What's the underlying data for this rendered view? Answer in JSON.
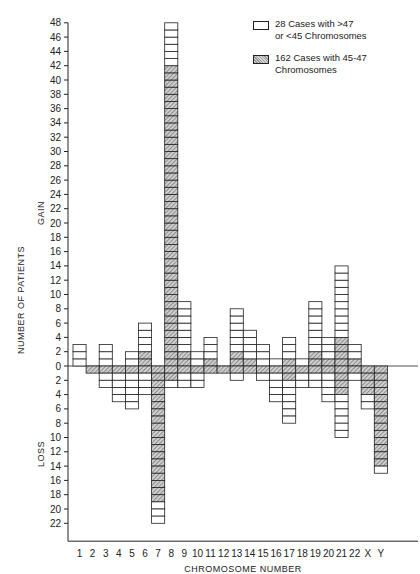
{
  "chart_data": {
    "type": "bar",
    "title": "",
    "xlabel": "CHROMOSOME NUMBER",
    "ylabel": "NUMBER OF PATIENTS",
    "y_region_labels": {
      "gain": "GAIN",
      "loss": "LOSS"
    },
    "categories": [
      "1",
      "2",
      "3",
      "4",
      "5",
      "6",
      "7",
      "8",
      "9",
      "10",
      "11",
      "12",
      "13",
      "14",
      "15",
      "16",
      "17",
      "18",
      "19",
      "20",
      "21",
      "22",
      "X",
      "Y"
    ],
    "y_ticks_gain": [
      0,
      2,
      4,
      6,
      8,
      10,
      12,
      14,
      16,
      18,
      20,
      22,
      24,
      26,
      28,
      30,
      32,
      34,
      36,
      38,
      40,
      42,
      44,
      46,
      48
    ],
    "y_ticks_loss": [
      2,
      4,
      6,
      8,
      10,
      12,
      14,
      16,
      18,
      20,
      22
    ],
    "ylim": [
      -24,
      48
    ],
    "series": [
      {
        "name": "28 Cases with >47 or <45 Chromosomes",
        "style": "open",
        "gain": [
          3,
          0,
          3,
          0,
          2,
          4,
          0,
          6,
          7,
          2,
          3,
          0,
          6,
          4,
          3,
          1,
          3,
          1,
          7,
          3,
          10,
          2,
          0,
          0
        ],
        "loss": [
          0,
          0,
          2,
          4,
          5,
          3,
          3,
          1,
          2,
          2,
          0,
          0,
          1,
          0,
          1,
          4,
          6,
          2,
          2,
          4,
          6,
          1,
          2,
          1
        ]
      },
      {
        "name": "162 Cases with 45-47 Chromosomes",
        "style": "shaded",
        "gain": [
          0,
          0,
          0,
          0,
          0,
          2,
          0,
          42,
          2,
          0,
          1,
          0,
          2,
          1,
          0,
          0,
          1,
          0,
          2,
          1,
          4,
          1,
          0,
          0
        ],
        "loss": [
          0,
          1,
          1,
          1,
          1,
          1,
          19,
          2,
          1,
          1,
          1,
          1,
          1,
          1,
          1,
          1,
          2,
          1,
          1,
          1,
          4,
          1,
          4,
          14
        ]
      }
    ],
    "totals_gain": [
      3,
      0,
      3,
      0,
      2,
      6,
      0,
      48,
      9,
      2,
      4,
      0,
      8,
      5,
      3,
      1,
      4,
      1,
      9,
      4,
      14,
      3,
      0,
      0
    ],
    "totals_loss": [
      0,
      1,
      3,
      5,
      6,
      4,
      22,
      3,
      3,
      3,
      1,
      1,
      2,
      1,
      2,
      5,
      8,
      3,
      3,
      5,
      10,
      2,
      6,
      15
    ],
    "legend_position": "top-right",
    "grid": false
  },
  "legend": {
    "open_label_1": "28 Cases with >47",
    "open_label_2": "or <45 Chromosomes",
    "shaded_label_1": "162 Cases with 45-47",
    "shaded_label_2": "Chromosomes"
  }
}
